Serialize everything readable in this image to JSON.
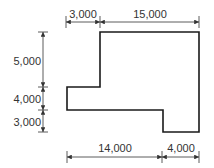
{
  "diagram": {
    "colors": {
      "outline": "#1a1a1a",
      "dimension": "#333333"
    },
    "dimensions": {
      "top_left": "3,000",
      "top_right": "15,000",
      "left_top": "5,000",
      "left_middle": "4,000",
      "left_bottom": "3,000",
      "bottom_left": "14,000",
      "bottom_right": "4,000"
    }
  }
}
